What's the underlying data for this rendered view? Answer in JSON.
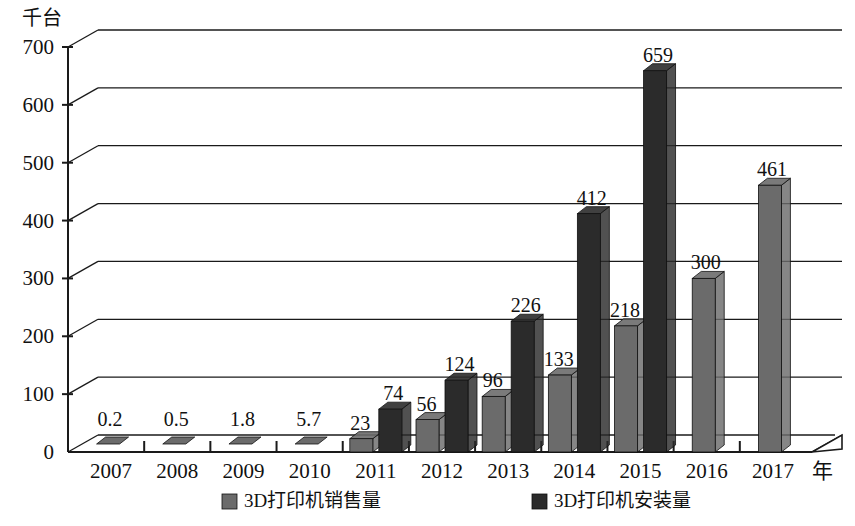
{
  "chart_data": {
    "type": "bar",
    "title": "",
    "ylabel": "千台",
    "xlabel": "年",
    "categories": [
      "2007",
      "2008",
      "2009",
      "2010",
      "2011",
      "2012",
      "2013",
      "2014",
      "2015",
      "2016",
      "2017"
    ],
    "series": [
      {
        "name": "3D打印机销售量",
        "color": "#6b6b6b",
        "values": [
          0.2,
          0.5,
          1.8,
          5.7,
          23,
          56,
          96,
          133,
          218,
          300,
          461
        ],
        "labels": [
          "0.2",
          "0.5",
          "1.8",
          "5.7",
          "23",
          "56",
          "96",
          "133",
          "218",
          "300",
          "461"
        ]
      },
      {
        "name": "3D打印机安装量",
        "color": "#2b2b2b",
        "values": [
          null,
          null,
          null,
          null,
          74,
          124,
          226,
          412,
          659,
          null,
          null
        ],
        "labels": [
          "",
          "",
          "",
          "",
          "74",
          "124",
          "226",
          "412",
          "659",
          "",
          ""
        ]
      }
    ],
    "ylim": [
      0,
      700
    ],
    "yticks": [
      "0",
      "100",
      "200",
      "300",
      "400",
      "500",
      "600",
      "700"
    ],
    "grid": true,
    "legend_position": "bottom"
  },
  "legend": {
    "items": [
      {
        "label": "3D打印机销售量",
        "swatch": "#6b6b6b"
      },
      {
        "label": "3D打印机安装量",
        "swatch": "#2b2b2b"
      }
    ]
  }
}
